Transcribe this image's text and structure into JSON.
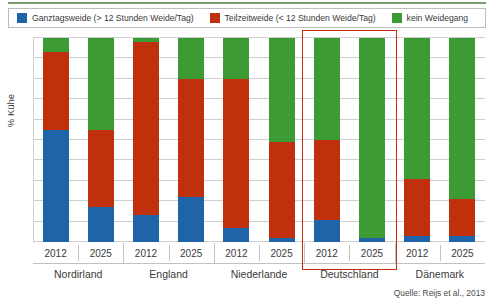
{
  "legend": {
    "items": [
      {
        "label": "Ganztagsweide (> 12 Stunden Weide/Tag)",
        "color": "#1f63a8",
        "key": "ganztagsweide"
      },
      {
        "label": "Teilzeitweide (< 12 Stunden Weide/Tag)",
        "color": "#c0300c",
        "key": "teilzeitweide"
      },
      {
        "label": "kein Weidegang",
        "color": "#3d9b35",
        "key": "kein_weidegang"
      }
    ]
  },
  "axes": {
    "ylabel": "% Kühe",
    "ylim": [
      0,
      100
    ],
    "ytick_step": 10,
    "grid": true
  },
  "source": "Quelle: Reijs et al., 2013",
  "highlight": {
    "group": "Deutschland",
    "color": "#c0300c"
  },
  "chart_data": {
    "type": "bar",
    "stacked": true,
    "title": "",
    "xlabel": "",
    "ylabel": "% Kühe",
    "ylim": [
      0,
      100
    ],
    "grid": true,
    "legend_position": "top",
    "categories": [
      "Nordirland 2012",
      "Nordirland 2025",
      "England 2012",
      "England 2025",
      "Niederlande 2012",
      "Niederlande 2025",
      "Deutschland 2012",
      "Deutschland 2025",
      "Dänemark 2012",
      "Dänemark 2025"
    ],
    "groups": [
      {
        "country": "Nordirland",
        "years": [
          "2012",
          "2025"
        ]
      },
      {
        "country": "England",
        "years": [
          "2012",
          "2025"
        ]
      },
      {
        "country": "Niederlande",
        "years": [
          "2012",
          "2025"
        ]
      },
      {
        "country": "Deutschland",
        "years": [
          "2012",
          "2025"
        ]
      },
      {
        "country": "Dänemark",
        "years": [
          "2012",
          "2025"
        ]
      }
    ],
    "series": [
      {
        "name": "Ganztagsweide (> 12 Stunden Weide/Tag)",
        "color": "#1f63a8",
        "values": [
          55,
          17,
          13,
          22,
          7,
          2,
          11,
          2,
          3,
          3
        ]
      },
      {
        "name": "Teilzeitweide (< 12 Stunden Weide/Tag)",
        "color": "#c0300c",
        "values": [
          38,
          38,
          85,
          58,
          73,
          47,
          39,
          0,
          28,
          18
        ]
      },
      {
        "name": "kein Weidegang",
        "color": "#3d9b35",
        "values": [
          7,
          45,
          2,
          20,
          20,
          51,
          50,
          98,
          69,
          79
        ]
      }
    ],
    "bars": [
      {
        "country": "Nordirland",
        "year": "2012",
        "ganztagsweide": 55,
        "teilzeitweide": 38,
        "kein_weidegang": 7
      },
      {
        "country": "Nordirland",
        "year": "2025",
        "ganztagsweide": 17,
        "teilzeitweide": 38,
        "kein_weidegang": 45
      },
      {
        "country": "England",
        "year": "2012",
        "ganztagsweide": 13,
        "teilzeitweide": 85,
        "kein_weidegang": 2
      },
      {
        "country": "England",
        "year": "2025",
        "ganztagsweide": 22,
        "teilzeitweide": 58,
        "kein_weidegang": 20
      },
      {
        "country": "Niederlande",
        "year": "2012",
        "ganztagsweide": 7,
        "teilzeitweide": 73,
        "kein_weidegang": 20
      },
      {
        "country": "Niederlande",
        "year": "2025",
        "ganztagsweide": 2,
        "teilzeitweide": 47,
        "kein_weidegang": 51
      },
      {
        "country": "Deutschland",
        "year": "2012",
        "ganztagsweide": 11,
        "teilzeitweide": 39,
        "kein_weidegang": 50
      },
      {
        "country": "Deutschland",
        "year": "2025",
        "ganztagsweide": 2,
        "teilzeitweide": 0,
        "kein_weidegang": 98
      },
      {
        "country": "Dänemark",
        "year": "2012",
        "ganztagsweide": 3,
        "teilzeitweide": 28,
        "kein_weidegang": 69
      },
      {
        "country": "Dänemark",
        "year": "2025",
        "ganztagsweide": 3,
        "teilzeitweide": 18,
        "kein_weidegang": 79
      }
    ]
  }
}
